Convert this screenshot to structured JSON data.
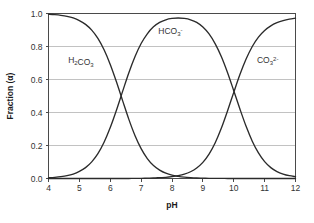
{
  "chart_data": {
    "type": "line",
    "title": "",
    "subtitle": "",
    "xlabel": "pH",
    "ylabel": "Fraction (α)",
    "xlim": [
      4,
      12
    ],
    "ylim": [
      0,
      1
    ],
    "grid": true,
    "grid_axis": "y",
    "legend": "inline-annotations",
    "x_ticks": [
      "4",
      "5",
      "6",
      "7",
      "8",
      "9",
      "10",
      "11",
      "12"
    ],
    "x_tick_values": [
      4,
      5,
      6,
      7,
      8,
      9,
      10,
      11,
      12
    ],
    "y_ticks": [
      "0.0",
      "0.2",
      "0.4",
      "0.6",
      "0.8",
      "1.0"
    ],
    "y_tick_values": [
      0.0,
      0.2,
      0.4,
      0.6,
      0.8,
      1.0
    ],
    "x": [
      4.0,
      4.2,
      4.4,
      4.6,
      4.8,
      5.0,
      5.2,
      5.4,
      5.6,
      5.8,
      6.0,
      6.2,
      6.4,
      6.6,
      6.8,
      7.0,
      7.2,
      7.4,
      7.6,
      7.8,
      8.0,
      8.2,
      8.4,
      8.6,
      8.8,
      9.0,
      9.2,
      9.4,
      9.6,
      9.8,
      10.0,
      10.2,
      10.4,
      10.6,
      10.8,
      11.0,
      11.2,
      11.4,
      11.6,
      11.8,
      12.0
    ],
    "series": [
      {
        "name": "H2CO3",
        "label": "H₂CO₃",
        "label_parts": [
          {
            "t": "H",
            "k": "n"
          },
          {
            "t": "2",
            "k": "sub"
          },
          {
            "t": "CO",
            "k": "n"
          },
          {
            "t": "3",
            "k": "sub"
          }
        ],
        "color": "#2b2b2b",
        "label_x": 5.05,
        "label_y": 0.7,
        "values": [
          0.996,
          0.993,
          0.989,
          0.983,
          0.973,
          0.957,
          0.934,
          0.899,
          0.849,
          0.78,
          0.691,
          0.586,
          0.472,
          0.36,
          0.261,
          0.181,
          0.121,
          0.079,
          0.051,
          0.032,
          0.02,
          0.013,
          0.008,
          0.005,
          0.003,
          0.002,
          0.001,
          0.001,
          0.001,
          0.0,
          0.0,
          0.0,
          0.0,
          0.0,
          0.0,
          0.0,
          0.0,
          0.0,
          0.0,
          0.0,
          0.0
        ]
      },
      {
        "name": "HCO3-",
        "label": "HCO₃⁻",
        "label_parts": [
          {
            "t": "HCO",
            "k": "n"
          },
          {
            "t": "3",
            "k": "sub"
          },
          {
            "t": "-",
            "k": "sup"
          }
        ],
        "color": "#2b2b2b",
        "label_x": 7.95,
        "label_y": 0.875,
        "values": [
          0.004,
          0.007,
          0.011,
          0.017,
          0.027,
          0.043,
          0.066,
          0.101,
          0.151,
          0.22,
          0.309,
          0.414,
          0.528,
          0.64,
          0.738,
          0.818,
          0.877,
          0.919,
          0.946,
          0.962,
          0.97,
          0.973,
          0.97,
          0.962,
          0.946,
          0.918,
          0.876,
          0.816,
          0.738,
          0.641,
          0.532,
          0.421,
          0.316,
          0.226,
          0.155,
          0.102,
          0.066,
          0.042,
          0.027,
          0.017,
          0.011
        ]
      },
      {
        "name": "CO3 2-",
        "label": "CO₃²⁻",
        "label_parts": [
          {
            "t": "CO",
            "k": "n"
          },
          {
            "t": "3",
            "k": "sub"
          },
          {
            "t": "2-",
            "k": "sup"
          }
        ],
        "color": "#2b2b2b",
        "label_x": 11.1,
        "label_y": 0.7,
        "values": [
          0.0,
          0.0,
          0.0,
          0.0,
          0.0,
          0.0,
          0.0,
          0.0,
          0.0,
          0.0,
          0.0,
          0.0,
          0.0,
          0.0,
          0.001,
          0.001,
          0.002,
          0.003,
          0.005,
          0.007,
          0.011,
          0.017,
          0.026,
          0.041,
          0.064,
          0.098,
          0.148,
          0.217,
          0.306,
          0.411,
          0.522,
          0.63,
          0.724,
          0.8,
          0.857,
          0.897,
          0.925,
          0.944,
          0.957,
          0.966,
          0.972
        ]
      }
    ],
    "annotations": [
      {
        "text": "pKa1 crossover",
        "x": 6.35,
        "y": 0.5
      },
      {
        "text": "pKa2 crossover",
        "x": 10.33,
        "y": 0.5
      }
    ]
  }
}
